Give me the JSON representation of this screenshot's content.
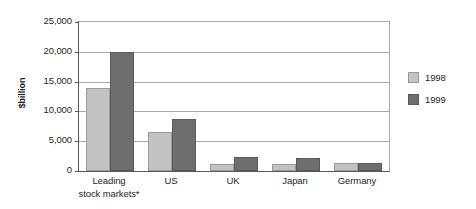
{
  "chart_data": {
    "type": "bar",
    "title": "",
    "subtitle": "",
    "xlabel": "",
    "ylabel": "$billion",
    "ylim": [
      0,
      25000
    ],
    "ytick_values": [
      0,
      5000,
      10000,
      15000,
      20000,
      25000
    ],
    "ytick_labels": [
      "0",
      "5,000",
      "10,000",
      "15,000",
      "20,000",
      "25,000"
    ],
    "grid": true,
    "legend_position": "right",
    "categories": [
      "Leading\nstock markets*",
      "US",
      "UK",
      "Japan",
      "Germany"
    ],
    "category_lines": [
      [
        "Leading",
        "stock markets*"
      ],
      [
        "US"
      ],
      [
        "UK"
      ],
      [
        "Japan"
      ],
      [
        "Germany"
      ]
    ],
    "series": [
      {
        "name": "1998",
        "color": "#c2c2c2",
        "values": [
          14000,
          6600,
          1200,
          1200,
          1400
        ]
      },
      {
        "name": "1999",
        "color": "#6e6e6e",
        "values": [
          20000,
          8700,
          2400,
          2100,
          1400
        ]
      }
    ],
    "footnote_marker": "*"
  },
  "legend": {
    "items": [
      {
        "label": "1998",
        "swatch": "#c2c2c2"
      },
      {
        "label": "1999",
        "swatch": "#6e6e6e"
      }
    ]
  },
  "colors": {
    "series_1998": "#c2c2c2",
    "series_1999": "#6e6e6e",
    "gridline": "#a7a9ac",
    "axis": "#58595b",
    "text": "#231f20",
    "background": "#ffffff"
  }
}
